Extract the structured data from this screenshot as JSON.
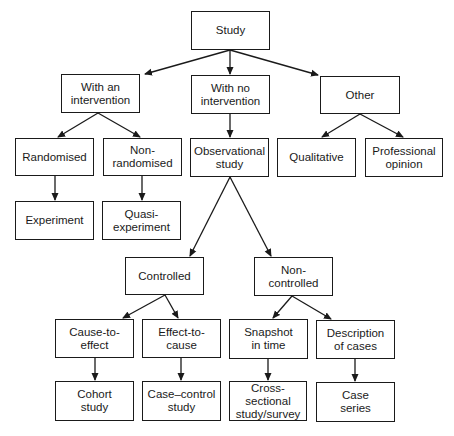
{
  "diagram": {
    "nodes": [
      {
        "id": "study",
        "label": "Study",
        "x": 191,
        "y": 11,
        "w": 79,
        "h": 39
      },
      {
        "id": "with_intervention",
        "label": "With an\nintervention",
        "x": 61,
        "y": 74,
        "w": 79,
        "h": 39
      },
      {
        "id": "no_intervention",
        "label": "With no\nintervention",
        "x": 191,
        "y": 75,
        "w": 79,
        "h": 39
      },
      {
        "id": "other",
        "label": "Other",
        "x": 320,
        "y": 76,
        "w": 80,
        "h": 38
      },
      {
        "id": "randomised",
        "label": "Randomised",
        "x": 15,
        "y": 138,
        "w": 79,
        "h": 38
      },
      {
        "id": "non_randomised",
        "label": "Non-\nrandomised",
        "x": 103,
        "y": 138,
        "w": 79,
        "h": 38
      },
      {
        "id": "observational",
        "label": "Observational\nstudy",
        "x": 190,
        "y": 138,
        "w": 79,
        "h": 39
      },
      {
        "id": "qualitative",
        "label": "Qualitative",
        "x": 277,
        "y": 138,
        "w": 79,
        "h": 39
      },
      {
        "id": "professional_opinion",
        "label": "Professional\nopinion",
        "x": 365,
        "y": 138,
        "w": 78,
        "h": 39
      },
      {
        "id": "experiment",
        "label": "Experiment",
        "x": 15,
        "y": 201,
        "w": 79,
        "h": 39
      },
      {
        "id": "quasi_experiment",
        "label": "Quasi-\nexperiment",
        "x": 102,
        "y": 201,
        "w": 79,
        "h": 39
      },
      {
        "id": "controlled",
        "label": "Controlled",
        "x": 125,
        "y": 257,
        "w": 79,
        "h": 38
      },
      {
        "id": "non_controlled",
        "label": "Non-\ncontrolled",
        "x": 254,
        "y": 257,
        "w": 79,
        "h": 39
      },
      {
        "id": "cause_to_effect",
        "label": "Cause-to-\neffect",
        "x": 55,
        "y": 319,
        "w": 79,
        "h": 39
      },
      {
        "id": "effect_to_cause",
        "label": "Effect-to-\ncause",
        "x": 142,
        "y": 319,
        "w": 79,
        "h": 39
      },
      {
        "id": "snapshot",
        "label": "Snapshot\nin time",
        "x": 229,
        "y": 319,
        "w": 79,
        "h": 40
      },
      {
        "id": "description_cases",
        "label": "Description\nof cases",
        "x": 316,
        "y": 320,
        "w": 79,
        "h": 39
      },
      {
        "id": "cohort",
        "label": "Cohort\nstudy",
        "x": 55,
        "y": 381,
        "w": 79,
        "h": 40
      },
      {
        "id": "case_control",
        "label": "Case–control\nstudy",
        "x": 142,
        "y": 381,
        "w": 79,
        "h": 40
      },
      {
        "id": "cross_sectional",
        "label": "Cross-sectional\nstudy/survey",
        "x": 229,
        "y": 381,
        "w": 78,
        "h": 40
      },
      {
        "id": "case_series",
        "label": "Case\nseries",
        "x": 316,
        "y": 382,
        "w": 79,
        "h": 40
      }
    ],
    "edges": [
      {
        "from": "study",
        "to": "with_intervention",
        "x1": 230,
        "y1": 50,
        "x2": 145,
        "y2": 74
      },
      {
        "from": "study",
        "to": "no_intervention",
        "x1": 230,
        "y1": 50,
        "x2": 230,
        "y2": 74
      },
      {
        "from": "study",
        "to": "other",
        "x1": 230,
        "y1": 50,
        "x2": 318,
        "y2": 75
      },
      {
        "from": "with_intervention",
        "to": "randomised",
        "x1": 98,
        "y1": 113,
        "x2": 58,
        "y2": 137
      },
      {
        "from": "with_intervention",
        "to": "non_randomised",
        "x1": 98,
        "y1": 113,
        "x2": 140,
        "y2": 137
      },
      {
        "from": "no_intervention",
        "to": "observational",
        "x1": 230,
        "y1": 114,
        "x2": 230,
        "y2": 137
      },
      {
        "from": "other",
        "to": "qualitative",
        "x1": 360,
        "y1": 114,
        "x2": 322,
        "y2": 137
      },
      {
        "from": "other",
        "to": "professional_opinion",
        "x1": 360,
        "y1": 114,
        "x2": 403,
        "y2": 137
      },
      {
        "from": "randomised",
        "to": "experiment",
        "x1": 55,
        "y1": 176,
        "x2": 55,
        "y2": 200
      },
      {
        "from": "non_randomised",
        "to": "quasi_experiment",
        "x1": 142,
        "y1": 176,
        "x2": 142,
        "y2": 200
      },
      {
        "from": "observational",
        "to": "controlled",
        "x1": 230,
        "y1": 177,
        "x2": 190,
        "y2": 256
      },
      {
        "from": "observational",
        "to": "non_controlled",
        "x1": 230,
        "y1": 177,
        "x2": 271,
        "y2": 256
      },
      {
        "from": "controlled",
        "to": "cause_to_effect",
        "x1": 165,
        "y1": 295,
        "x2": 123,
        "y2": 318
      },
      {
        "from": "controlled",
        "to": "effect_to_cause",
        "x1": 165,
        "y1": 295,
        "x2": 178,
        "y2": 318
      },
      {
        "from": "non_controlled",
        "to": "snapshot",
        "x1": 292,
        "y1": 296,
        "x2": 273,
        "y2": 318
      },
      {
        "from": "non_controlled",
        "to": "description_cases",
        "x1": 292,
        "y1": 296,
        "x2": 331,
        "y2": 319
      },
      {
        "from": "cause_to_effect",
        "to": "cohort",
        "x1": 95,
        "y1": 358,
        "x2": 95,
        "y2": 380
      },
      {
        "from": "effect_to_cause",
        "to": "case_control",
        "x1": 181,
        "y1": 358,
        "x2": 181,
        "y2": 380
      },
      {
        "from": "snapshot",
        "to": "cross_sectional",
        "x1": 268,
        "y1": 359,
        "x2": 268,
        "y2": 380
      },
      {
        "from": "description_cases",
        "to": "case_series",
        "x1": 355,
        "y1": 359,
        "x2": 355,
        "y2": 381
      }
    ],
    "colors": {
      "line": "#1a1a1a",
      "background": "#ffffff"
    }
  }
}
